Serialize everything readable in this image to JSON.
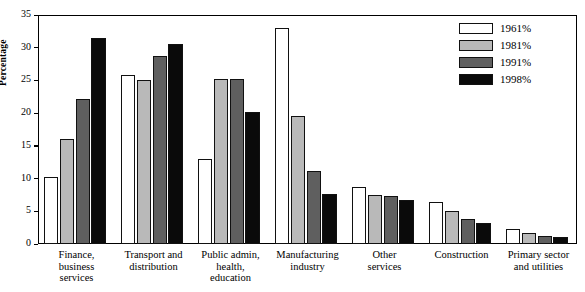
{
  "chart_data": {
    "type": "bar",
    "title": "",
    "xlabel": "",
    "ylabel": "Percentage",
    "ylim": [
      0,
      35
    ],
    "yticks": [
      0,
      5,
      10,
      15,
      20,
      25,
      30,
      35
    ],
    "grid": false,
    "legend_position": "top-right",
    "categories": [
      "Finance, business services",
      "Transport and distribution",
      "Public admin, health, education",
      "Manufacturing industry",
      "Other services",
      "Construction",
      "Primary sector and utilities"
    ],
    "category_lines": [
      [
        "Finance,",
        "business",
        "services"
      ],
      [
        "Transport and",
        "distribution"
      ],
      [
        "Public admin,",
        "health,",
        "education"
      ],
      [
        "Manufacturing",
        "industry"
      ],
      [
        "Other",
        "services"
      ],
      [
        "Construction"
      ],
      [
        "Primary sector",
        "and utilities"
      ]
    ],
    "series": [
      {
        "name": "1961%",
        "color": "#ffffff",
        "values": [
          10.2,
          25.8,
          13.0,
          33.0,
          8.7,
          6.4,
          2.3
        ]
      },
      {
        "name": "1981%",
        "color": "#b9b9b9",
        "values": [
          16.1,
          25.1,
          25.2,
          19.6,
          7.5,
          5.0,
          1.7
        ]
      },
      {
        "name": "1991%",
        "color": "#5f5f5f",
        "values": [
          22.2,
          28.8,
          25.2,
          11.2,
          7.3,
          3.8,
          1.3
        ]
      },
      {
        "name": "1998%",
        "color": "#0a0a0a",
        "values": [
          31.5,
          30.6,
          20.2,
          7.7,
          6.7,
          3.2,
          1.0
        ]
      }
    ]
  },
  "axis": {
    "y_title": "Percentage",
    "y_tick_labels": [
      "0",
      "5",
      "10",
      "15",
      "20",
      "25",
      "30",
      "35"
    ]
  },
  "legend": {
    "items": [
      {
        "label": "1961%",
        "swatch": "c1961"
      },
      {
        "label": "1981%",
        "swatch": "c1981"
      },
      {
        "label": "1991%",
        "swatch": "c1991"
      },
      {
        "label": "1998%",
        "swatch": "c1998"
      }
    ]
  }
}
